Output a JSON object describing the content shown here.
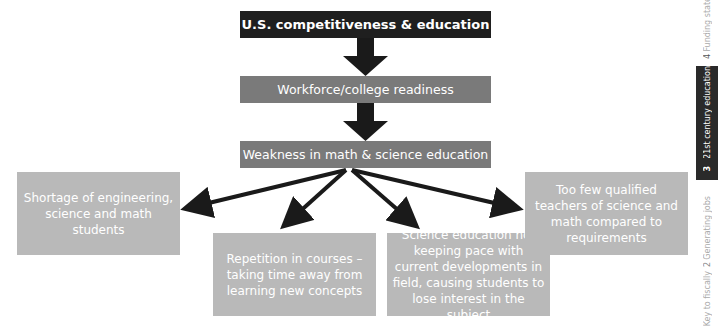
{
  "diagram": {
    "top": "U.S. competitiveness & education",
    "level2": "Workforce/college readiness",
    "level3": "Weakness in math & science education",
    "outcomes": [
      "Shortage of engineering, science and math students",
      "Repetition in courses – taking time away from learning new concepts",
      "Science education not keeping pace with current developments in field, causing students to lose interest in the subject",
      "Too few qualified teachers of science and math compared to requirements"
    ]
  },
  "sidebar": {
    "tab4_label": "Funding state",
    "tab4_number": "4",
    "tab3_label": "21st century education",
    "tab3_number": "3",
    "tab2_label": "Generating jobs",
    "tab2_number": "2",
    "tab1_label": "Key to fiscally"
  },
  "colors": {
    "top_box": "#1f1f1f",
    "mid_box": "#7a7a7a",
    "outcome_box": "#b9b9b9",
    "arrow": "#1a1a1a"
  }
}
